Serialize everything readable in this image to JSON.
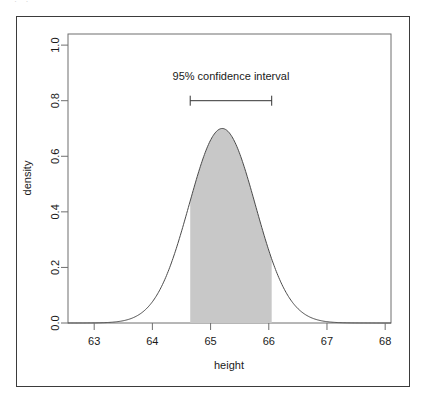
{
  "figure": {
    "top_fragment_text": "· ·",
    "background_color": "#ffffff",
    "frame_color": "#3b3b3b"
  },
  "chart_data": {
    "type": "area",
    "title": "",
    "subtitle": "",
    "xlabel": "height",
    "ylabel": "density",
    "xlim": [
      62.55,
      68.1
    ],
    "ylim": [
      0.0,
      1.04
    ],
    "xticks": [
      63,
      64,
      65,
      66,
      67,
      68
    ],
    "xtick_labels": [
      "63",
      "64",
      "65",
      "66",
      "67",
      "68"
    ],
    "yticks": [
      0.0,
      0.2,
      0.4,
      0.6,
      0.8,
      1.0
    ],
    "ytick_labels": [
      "0.0",
      "0.2",
      "0.4",
      "0.6",
      "0.8",
      "1.0"
    ],
    "grid": false,
    "legend": null,
    "curve": {
      "name": "density",
      "distribution": "normal",
      "mean": 65.2,
      "sd": 0.57,
      "peak_density": 0.7,
      "line_color": "#4a4a4a",
      "line_width": 1.0
    },
    "shaded_region": {
      "label": "95% confidence interval region",
      "x_start": 64.65,
      "x_end": 66.05,
      "fill_color": "#c8c8c8",
      "edge_color": "#c8c8c8"
    },
    "annotations": [
      {
        "name": "confidence-interval",
        "text": "95% confidence interval",
        "x_start": 64.65,
        "x_end": 66.05,
        "y": 0.8,
        "text_y": 0.875,
        "style": "error-bar-with-end-caps",
        "color": "#333333"
      }
    ]
  }
}
